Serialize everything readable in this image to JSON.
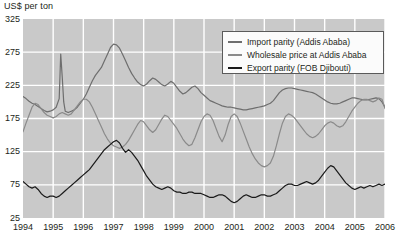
{
  "chart_data": {
    "type": "line",
    "title": "",
    "ylabel": "US$ per ton",
    "xlabel": "",
    "ylim": [
      25,
      325
    ],
    "yticks": [
      25,
      75,
      125,
      175,
      225,
      275,
      325
    ],
    "xlim": [
      1994,
      2006
    ],
    "xticks": [
      1994,
      1995,
      1996,
      1997,
      1998,
      1999,
      2000,
      2001,
      2002,
      2003,
      2004,
      2005,
      2006
    ],
    "grid": true,
    "legend_position": "top-right",
    "plot_background": "#c9c9c9",
    "gridline_color": "#ffffff",
    "series": [
      {
        "name": "Import parity (Addis Ababa)",
        "color": "#6e6e6e",
        "x": [
          1994.0,
          1994.1,
          1994.2,
          1994.3,
          1994.4,
          1994.5,
          1994.6,
          1994.7,
          1994.8,
          1994.9,
          1995.0,
          1995.1,
          1995.2,
          1995.25,
          1995.3,
          1995.35,
          1995.4,
          1995.5,
          1995.6,
          1995.7,
          1995.8,
          1995.9,
          1996.0,
          1996.1,
          1996.2,
          1996.3,
          1996.4,
          1996.5,
          1996.6,
          1996.7,
          1996.8,
          1996.9,
          1997.0,
          1997.1,
          1997.2,
          1997.3,
          1997.4,
          1997.5,
          1997.6,
          1997.7,
          1997.8,
          1997.9,
          1998.0,
          1998.1,
          1998.2,
          1998.3,
          1998.4,
          1998.5,
          1998.6,
          1998.7,
          1998.8,
          1998.9,
          1999.0,
          1999.1,
          1999.2,
          1999.3,
          1999.4,
          1999.5,
          1999.6,
          1999.7,
          1999.8,
          1999.9,
          2000.0,
          2000.1,
          2000.2,
          2000.3,
          2000.4,
          2000.5,
          2000.6,
          2000.7,
          2000.8,
          2000.9,
          2001.0,
          2001.1,
          2001.2,
          2001.3,
          2001.4,
          2001.5,
          2001.6,
          2001.7,
          2001.8,
          2001.9,
          2002.0,
          2002.1,
          2002.2,
          2002.3,
          2002.4,
          2002.5,
          2002.6,
          2002.7,
          2002.8,
          2002.9,
          2003.0,
          2003.1,
          2003.2,
          2003.3,
          2003.4,
          2003.5,
          2003.6,
          2003.7,
          2003.8,
          2003.9,
          2004.0,
          2004.1,
          2004.2,
          2004.3,
          2004.4,
          2004.5,
          2004.6,
          2004.7,
          2004.8,
          2004.9,
          2005.0,
          2005.1,
          2005.2,
          2005.3,
          2005.4,
          2005.5,
          2005.6,
          2005.7,
          2005.8,
          2005.9,
          2006.0
        ],
        "values": [
          208,
          205,
          201,
          198,
          196,
          193,
          190,
          187,
          185,
          186,
          188,
          192,
          205,
          272,
          238,
          200,
          186,
          184,
          186,
          188,
          192,
          198,
          204,
          212,
          222,
          232,
          240,
          246,
          252,
          262,
          272,
          282,
          287,
          286,
          281,
          272,
          262,
          252,
          243,
          236,
          230,
          226,
          224,
          227,
          232,
          236,
          234,
          230,
          226,
          224,
          227,
          231,
          228,
          222,
          216,
          212,
          214,
          218,
          222,
          224,
          220,
          214,
          210,
          206,
          202,
          200,
          198,
          196,
          194,
          193,
          192,
          192,
          191,
          190,
          189,
          188,
          188,
          189,
          190,
          191,
          192,
          193,
          194,
          196,
          198,
          202,
          208,
          214,
          218,
          220,
          221,
          221,
          220,
          219,
          218,
          217,
          216,
          215,
          214,
          212,
          209,
          206,
          203,
          200,
          198,
          197,
          197,
          198,
          200,
          202,
          204,
          206,
          206,
          205,
          204,
          203,
          203,
          204,
          205,
          206,
          205,
          200,
          192
        ]
      },
      {
        "name": "Wholesale price at Addis Ababa",
        "color": "#8a8a8a",
        "x": [
          1994.0,
          1994.1,
          1994.2,
          1994.3,
          1994.4,
          1994.5,
          1994.6,
          1994.7,
          1994.8,
          1994.9,
          1995.0,
          1995.1,
          1995.2,
          1995.3,
          1995.4,
          1995.5,
          1995.6,
          1995.7,
          1995.8,
          1995.9,
          1996.0,
          1996.1,
          1996.2,
          1996.3,
          1996.4,
          1996.5,
          1996.6,
          1996.7,
          1996.8,
          1996.9,
          1997.0,
          1997.1,
          1997.2,
          1997.3,
          1997.4,
          1997.5,
          1997.6,
          1997.7,
          1997.8,
          1997.9,
          1998.0,
          1998.1,
          1998.2,
          1998.3,
          1998.4,
          1998.5,
          1998.6,
          1998.7,
          1998.8,
          1998.9,
          1999.0,
          1999.1,
          1999.2,
          1999.3,
          1999.4,
          1999.5,
          1999.6,
          1999.7,
          1999.8,
          1999.9,
          2000.0,
          2000.1,
          2000.2,
          2000.3,
          2000.4,
          2000.5,
          2000.6,
          2000.7,
          2000.8,
          2000.9,
          2001.0,
          2001.1,
          2001.2,
          2001.3,
          2001.4,
          2001.5,
          2001.6,
          2001.7,
          2001.8,
          2001.9,
          2002.0,
          2002.1,
          2002.2,
          2002.3,
          2002.4,
          2002.5,
          2002.6,
          2002.7,
          2002.8,
          2002.9,
          2003.0,
          2003.1,
          2003.2,
          2003.3,
          2003.4,
          2003.5,
          2003.6,
          2003.7,
          2003.8,
          2003.9,
          2004.0,
          2004.1,
          2004.2,
          2004.3,
          2004.4,
          2004.5,
          2004.6,
          2004.7,
          2004.8,
          2004.9,
          2005.0,
          2005.1,
          2005.2,
          2005.3,
          2005.4,
          2005.5,
          2005.6,
          2005.7,
          2005.8,
          2005.9,
          2006.0
        ],
        "values": [
          155,
          168,
          180,
          192,
          198,
          196,
          190,
          184,
          180,
          178,
          176,
          178,
          182,
          184,
          182,
          180,
          182,
          188,
          194,
          200,
          204,
          204,
          200,
          192,
          182,
          172,
          162,
          152,
          144,
          138,
          134,
          132,
          130,
          132,
          136,
          142,
          150,
          158,
          166,
          172,
          170,
          164,
          158,
          154,
          158,
          166,
          174,
          180,
          178,
          172,
          166,
          160,
          152,
          144,
          138,
          134,
          136,
          146,
          158,
          170,
          178,
          182,
          180,
          172,
          160,
          148,
          140,
          150,
          166,
          178,
          182,
          178,
          168,
          156,
          144,
          132,
          122,
          114,
          108,
          104,
          102,
          104,
          108,
          118,
          134,
          152,
          168,
          178,
          182,
          180,
          176,
          170,
          164,
          158,
          152,
          148,
          146,
          148,
          152,
          158,
          164,
          168,
          170,
          168,
          164,
          162,
          164,
          170,
          178,
          186,
          192,
          198,
          202,
          204,
          204,
          202,
          200,
          202,
          206,
          204,
          190
        ]
      },
      {
        "name": "Export parity (FOB Djibouti)",
        "color": "#1a1a1a",
        "x": [
          1994.0,
          1994.1,
          1994.2,
          1994.3,
          1994.4,
          1994.5,
          1994.6,
          1994.7,
          1994.8,
          1994.9,
          1995.0,
          1995.1,
          1995.2,
          1995.3,
          1995.4,
          1995.5,
          1995.6,
          1995.7,
          1995.8,
          1995.9,
          1996.0,
          1996.1,
          1996.2,
          1996.3,
          1996.4,
          1996.5,
          1996.6,
          1996.7,
          1996.8,
          1996.9,
          1997.0,
          1997.1,
          1997.2,
          1997.3,
          1997.4,
          1997.5,
          1997.6,
          1997.7,
          1997.8,
          1997.9,
          1998.0,
          1998.1,
          1998.2,
          1998.3,
          1998.4,
          1998.5,
          1998.6,
          1998.7,
          1998.8,
          1998.9,
          1999.0,
          1999.1,
          1999.2,
          1999.3,
          1999.4,
          1999.5,
          1999.6,
          1999.7,
          1999.8,
          1999.9,
          2000.0,
          2000.1,
          2000.2,
          2000.3,
          2000.4,
          2000.5,
          2000.6,
          2000.7,
          2000.8,
          2000.9,
          2001.0,
          2001.1,
          2001.2,
          2001.3,
          2001.4,
          2001.5,
          2001.6,
          2001.7,
          2001.8,
          2001.9,
          2002.0,
          2002.1,
          2002.2,
          2002.3,
          2002.4,
          2002.5,
          2002.6,
          2002.7,
          2002.8,
          2002.9,
          2003.0,
          2003.1,
          2003.2,
          2003.3,
          2003.4,
          2003.5,
          2003.6,
          2003.7,
          2003.8,
          2003.9,
          2004.0,
          2004.1,
          2004.2,
          2004.3,
          2004.4,
          2004.5,
          2004.6,
          2004.7,
          2004.8,
          2004.9,
          2005.0,
          2005.1,
          2005.2,
          2005.3,
          2005.4,
          2005.5,
          2005.6,
          2005.7,
          2005.8,
          2005.9,
          2006.0
        ],
        "values": [
          80,
          76,
          72,
          70,
          72,
          68,
          62,
          58,
          56,
          58,
          58,
          56,
          58,
          62,
          66,
          70,
          74,
          78,
          82,
          86,
          90,
          94,
          98,
          104,
          110,
          116,
          122,
          128,
          132,
          136,
          140,
          142,
          138,
          130,
          124,
          128,
          124,
          118,
          112,
          104,
          96,
          88,
          82,
          76,
          72,
          70,
          68,
          70,
          72,
          70,
          66,
          64,
          64,
          62,
          62,
          64,
          64,
          62,
          62,
          62,
          60,
          58,
          56,
          56,
          58,
          60,
          60,
          58,
          54,
          50,
          48,
          50,
          54,
          58,
          60,
          58,
          56,
          56,
          58,
          60,
          60,
          58,
          58,
          60,
          62,
          66,
          70,
          74,
          76,
          76,
          74,
          74,
          76,
          78,
          80,
          78,
          76,
          78,
          82,
          88,
          94,
          100,
          104,
          102,
          96,
          90,
          84,
          78,
          74,
          70,
          68,
          70,
          72,
          70,
          72,
          74,
          72,
          74,
          76,
          74,
          76
        ]
      }
    ]
  },
  "legend": {
    "items": [
      {
        "label": "Import parity (Addis Ababa)",
        "color": "#6e6e6e"
      },
      {
        "label": "Wholesale price at Addis Ababa",
        "color": "#8a8a8a"
      },
      {
        "label": "Export parity (FOB Djibouti)",
        "color": "#1a1a1a"
      }
    ]
  }
}
